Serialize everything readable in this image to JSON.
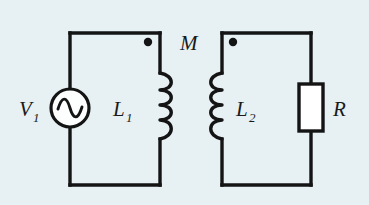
{
  "diagram": {
    "background_color": "#e7f1f4",
    "line_color": "#141414",
    "fill_color": "#ffffff",
    "labels": {
      "source": "V",
      "source_sub": "1",
      "inductor_primary": "L",
      "inductor_primary_sub": "1",
      "inductor_secondary": "L",
      "inductor_secondary_sub": "2",
      "mutual": "M",
      "resistor": "R"
    },
    "components": [
      {
        "name": "ac-voltage-source",
        "label": "V1",
        "type": "source"
      },
      {
        "name": "inductor-l1",
        "label": "L1",
        "type": "inductor",
        "turns": 4
      },
      {
        "name": "inductor-l2",
        "label": "L2",
        "type": "inductor",
        "turns": 4
      },
      {
        "name": "resistor-r",
        "label": "R",
        "type": "resistor"
      },
      {
        "name": "mutual-inductance",
        "label": "M",
        "type": "coupling"
      }
    ],
    "polarity_dots": [
      {
        "name": "dot-primary",
        "side": "left-loop-top-right"
      },
      {
        "name": "dot-secondary",
        "side": "right-loop-top-left"
      }
    ]
  }
}
